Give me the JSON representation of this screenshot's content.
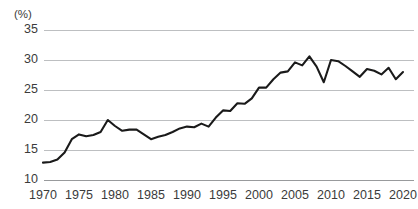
{
  "chart_data": {
    "type": "line",
    "title": "",
    "xlabel": "",
    "ylabel": "",
    "unit_label": "(%)",
    "xlim": [
      1970,
      2020
    ],
    "ylim": [
      10,
      35
    ],
    "grid": true,
    "legend": "none",
    "yticks": [
      35,
      30,
      25,
      20,
      15,
      10
    ],
    "xticks": [
      1970,
      1975,
      1980,
      1985,
      1990,
      1995,
      2000,
      2005,
      2010,
      2015,
      2020
    ],
    "series": [
      {
        "name": "ratio",
        "color": "#1a1a1a",
        "x": [
          1970,
          1971,
          1972,
          1973,
          1974,
          1975,
          1976,
          1977,
          1978,
          1979,
          1980,
          1981,
          1982,
          1983,
          1984,
          1985,
          1986,
          1987,
          1988,
          1989,
          1990,
          1991,
          1992,
          1993,
          1994,
          1995,
          1996,
          1997,
          1998,
          1999,
          2000,
          2001,
          2002,
          2003,
          2004,
          2005,
          2006,
          2007,
          2008,
          2009,
          2010,
          2011,
          2012,
          2013,
          2014,
          2015,
          2016,
          2017,
          2018,
          2019,
          2020
        ],
        "values": [
          12.9,
          13.0,
          13.4,
          14.6,
          16.8,
          17.6,
          17.3,
          17.5,
          18.0,
          20.0,
          19.0,
          18.2,
          18.4,
          18.4,
          17.6,
          16.8,
          17.2,
          17.5,
          18.0,
          18.6,
          18.9,
          18.8,
          19.4,
          18.9,
          20.4,
          21.6,
          21.5,
          22.8,
          22.7,
          23.6,
          25.4,
          25.4,
          26.8,
          27.9,
          28.1,
          29.6,
          29.1,
          30.6,
          28.9,
          26.3,
          30.0,
          29.8,
          29.0,
          28.1,
          27.2,
          28.5,
          28.2,
          27.6,
          28.7,
          26.8,
          28.0
        ]
      }
    ]
  },
  "axis": {
    "unit": "(%)",
    "y_labels": [
      "35",
      "30",
      "25",
      "20",
      "15",
      "10"
    ],
    "x_labels": [
      "1970",
      "1975",
      "1980",
      "1985",
      "1990",
      "1995",
      "2000",
      "2005",
      "2010",
      "2015",
      "2020"
    ]
  }
}
